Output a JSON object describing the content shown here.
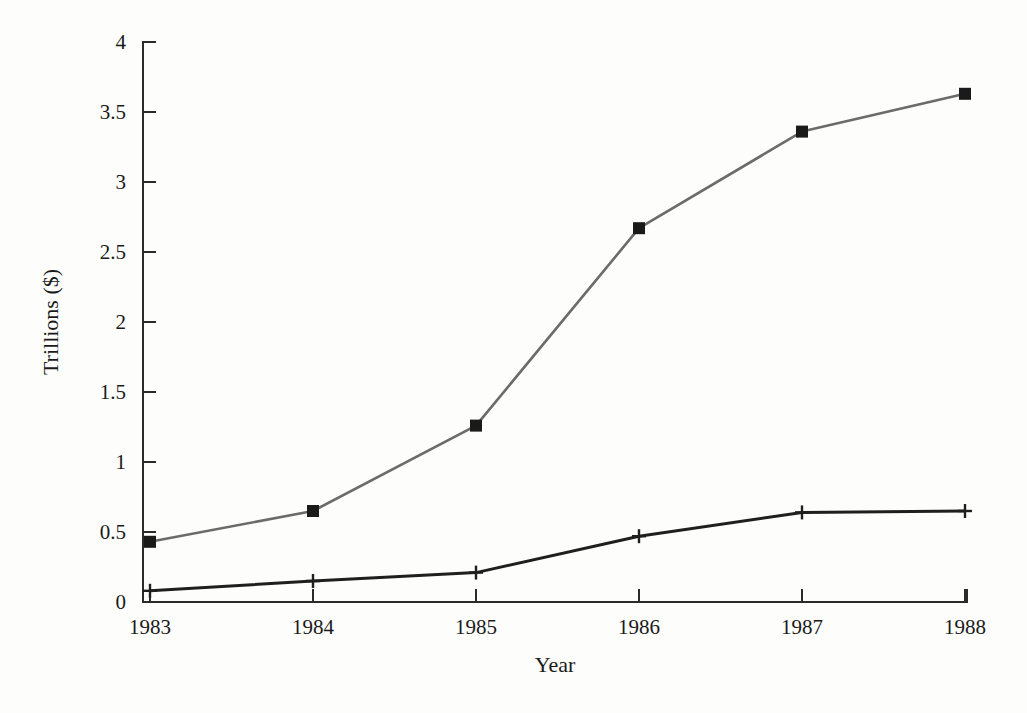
{
  "chart_data": {
    "type": "line",
    "title": "",
    "subtitle": "",
    "xlabel": "Year",
    "ylabel": "Trillions ($)",
    "x": [
      1983,
      1984,
      1985,
      1986,
      1987,
      1988
    ],
    "categories": [
      "1983",
      "1984",
      "1985",
      "1986",
      "1987",
      "1988"
    ],
    "xlim": [
      1983,
      1988
    ],
    "ylim": [
      0,
      4
    ],
    "xticks": [
      "1983",
      "1984",
      "1985",
      "1986",
      "1987",
      "1988"
    ],
    "yticks": [
      "0",
      "0.5",
      "1",
      "1.5",
      "2",
      "2.5",
      "3",
      "3.5",
      "4"
    ],
    "ytick_values": [
      0,
      0.5,
      1,
      1.5,
      2,
      2.5,
      3,
      3.5,
      4
    ],
    "grid": false,
    "legend": "none",
    "series": [
      {
        "name": "series-upper",
        "color": "#6b6b6b",
        "marker": "square",
        "marker_color": "#1a1a1a",
        "values": [
          0.43,
          0.65,
          1.26,
          2.67,
          3.36,
          3.63
        ]
      },
      {
        "name": "series-lower",
        "color": "#1f1f1f",
        "marker": "plus",
        "marker_color": "#1f1f1f",
        "values": [
          0.08,
          0.15,
          0.21,
          0.47,
          0.64,
          0.65
        ]
      }
    ],
    "annotations": []
  },
  "figure": {
    "background_color": "#fdfdfb",
    "axis_color": "#2b2b2b",
    "text_color": "#1a1a1a"
  }
}
